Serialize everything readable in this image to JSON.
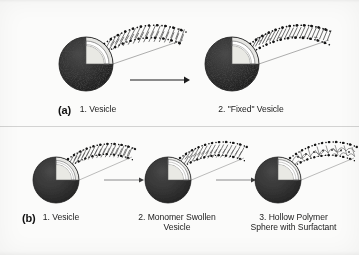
{
  "figure": {
    "background_color": "#fbfbfa",
    "ink_color": "#1b1b1b",
    "style": "scanned grayscale journal figure"
  },
  "panels": [
    {
      "letter": "(a)",
      "steps": [
        {
          "index": "1.",
          "caption": "1. Vesicle",
          "sphere": "stippled-vesicle-cutaway",
          "magnified_arc": "lipid-bilayer-arc",
          "arc_note": "two rows of black head-group dots with tails between"
        },
        {
          "index": "2.",
          "caption": "2. \"Fixed\" Vesicle",
          "sphere": "stippled-vesicle-cutaway",
          "magnified_arc": "polymerized-bilayer-arc",
          "arc_note": "crosslinked polymerized bilayer, denser tails"
        }
      ],
      "arrows": 1
    },
    {
      "letter": "(b)",
      "steps": [
        {
          "index": "1.",
          "caption": "1. Vesicle",
          "sphere": "stippled-vesicle-cutaway",
          "magnified_arc": "lipid-bilayer-arc",
          "arc_note": "two rows of black head-group dots with tails between"
        },
        {
          "index": "2.",
          "caption": "2. Monomer Swollen\nVesicle",
          "sphere": "stippled-vesicle-cutaway",
          "magnified_arc": "monomer-swollen-bilayer-arc",
          "arc_note": "bilayer swollen with monomer, thicker core"
        },
        {
          "index": "3.",
          "caption": "3. Hollow Polymer\nSphere with Surfactant",
          "sphere": "stippled-vesicle-cutaway",
          "magnified_arc": "hollow-polymer-shell-arc",
          "arc_note": "polymer shell with surfactant, tangled network"
        }
      ],
      "arrows": 2
    }
  ],
  "colors": {
    "sphere_dark": "#2f2f2f",
    "sphere_stipple": "#111111",
    "shell_light": "#f2f2ef",
    "shell_mid": "#b9b9b5",
    "head_group": "#121212",
    "tail": "#4a4a4a",
    "arrow": "#1b1b1b",
    "arrow_light": "#6e6e6e"
  }
}
